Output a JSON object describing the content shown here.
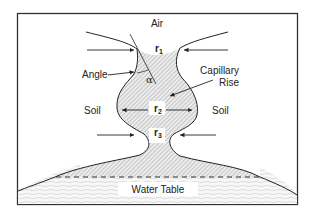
{
  "diagram": {
    "labels": {
      "air": "Air",
      "angle": "Angle",
      "alpha": "α",
      "capillary_line1": "Capillary",
      "capillary_line2": "Rise",
      "soil_left": "Soil",
      "soil_right": "Soil",
      "water_table": "Water Table"
    },
    "radii": [
      {
        "base": "r",
        "sub": "1"
      },
      {
        "base": "r",
        "sub": "2"
      },
      {
        "base": "r",
        "sub": "3"
      }
    ],
    "colors": {
      "stroke": "#222222",
      "hatch": "#8a8a8a",
      "fill": "#e6e6e6",
      "border": "#333333"
    }
  }
}
